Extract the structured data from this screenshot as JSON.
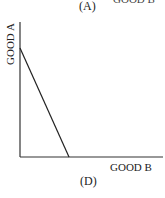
{
  "diagram": {
    "panel_label_top": "(A)",
    "panel_label_bottom": "(D)",
    "cut_off_text_top": "GOOD B",
    "x_axis_label": "GOOD B",
    "y_axis_label": "GOOD A",
    "line_description": "Straight downward-sloping line from Good A axis intercept to Good B axis intercept",
    "colors": {
      "axis": "#333333",
      "line": "#222222",
      "background": "#ffffff"
    }
  }
}
